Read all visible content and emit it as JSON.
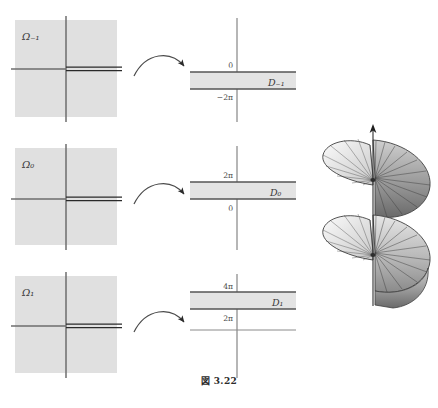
{
  "caption": "図 3.22",
  "domains": [
    {
      "name": "omega-minus-1",
      "label": "Ω₋₁",
      "slit_direction": "positive-real-axis"
    },
    {
      "name": "omega-0",
      "label": "Ω₀",
      "slit_direction": "positive-real-axis"
    },
    {
      "name": "omega-1",
      "label": "Ω₁",
      "slit_direction": "positive-real-axis"
    }
  ],
  "strips": [
    {
      "name": "d-minus-1",
      "label": "D₋₁",
      "top_tick": "0",
      "bottom_tick": "−2π",
      "extra_axis_tick": null
    },
    {
      "name": "d-0",
      "label": "D₀",
      "top_tick": "2π",
      "bottom_tick": "0",
      "extra_axis_tick": null
    },
    {
      "name": "d-1",
      "label": "D₁",
      "top_tick": "4π",
      "bottom_tick": "2π",
      "extra_axis_tick": "0"
    }
  ],
  "arrows": [
    {
      "name": "map-arrow-1",
      "glyph": "curved-arrow-right"
    },
    {
      "name": "map-arrow-2",
      "glyph": "curved-arrow-right"
    },
    {
      "name": "map-arrow-3",
      "glyph": "curved-arrow-right"
    }
  ],
  "helicoid": {
    "name": "riemann-surface-helicoid",
    "axis_arrow": "up-arrow",
    "turns": 2
  },
  "colors": {
    "domain_fill": "#e0e0e0",
    "strip_fill": "#e3e3e3",
    "axis_line": "#6e6e6e",
    "slit_line": "#2a2a2a",
    "strip_border": "#555555",
    "helicoid_dark": "#4a4a4a",
    "helicoid_light": "#d8d8d8",
    "text": "#3a3a3a"
  }
}
